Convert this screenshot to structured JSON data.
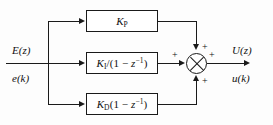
{
  "diagram": {
    "type": "control-block-diagram",
    "background_color": "#fdfdfd",
    "line_color": "#1a1a1a",
    "input": {
      "z_domain_label": "E(z)",
      "time_domain_label": "e(k)"
    },
    "output": {
      "z_domain_label": "U(z)",
      "time_domain_label": "u(k)"
    },
    "blocks": [
      {
        "id": "proportional",
        "label_html": "K<sub>P</sub>",
        "label_text": "K_P",
        "position": "top"
      },
      {
        "id": "integral",
        "label_html": "K<sub>I</sub><span class=\"rm\">/(1 &#8722; </span>z<sup class=\"rm\">&#8722;1</sup><span class=\"rm\">)</span>",
        "label_text": "K_I/(1 - z^-1)",
        "position": "middle"
      },
      {
        "id": "derivative",
        "label_html": "K<sub>D</sub><span class=\"rm\">(1 &#8722; </span>z<sup class=\"rm\">&#8722;1</sup><span class=\"rm\">)</span>",
        "label_text": "K_D(1 - z^-1)",
        "position": "bottom"
      }
    ],
    "summing_junction": {
      "symbol": "circle-with-x",
      "signs": [
        {
          "id": "top",
          "text": "+"
        },
        {
          "id": "left",
          "text": "+"
        },
        {
          "id": "right",
          "text": "+"
        },
        {
          "id": "bottom",
          "text": "+"
        }
      ]
    }
  }
}
